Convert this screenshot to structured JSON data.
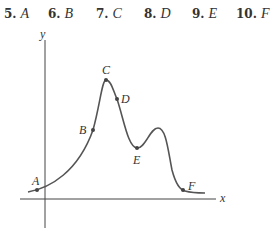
{
  "choices": [
    {
      "number": "5.",
      "letter": "A"
    },
    {
      "number": "6.",
      "letter": "B"
    },
    {
      "number": "7.",
      "letter": "C"
    },
    {
      "number": "8.",
      "letter": "D"
    },
    {
      "number": "9.",
      "letter": "E"
    },
    {
      "number": "10.",
      "letter": "F"
    }
  ],
  "graph": {
    "x_axis_label": "x",
    "y_axis_label": "y",
    "points": [
      {
        "label": "A"
      },
      {
        "label": "B"
      },
      {
        "label": "C"
      },
      {
        "label": "D"
      },
      {
        "label": "E"
      },
      {
        "label": "F"
      }
    ],
    "curve_color": "#555555",
    "axis_color": "#444444"
  }
}
